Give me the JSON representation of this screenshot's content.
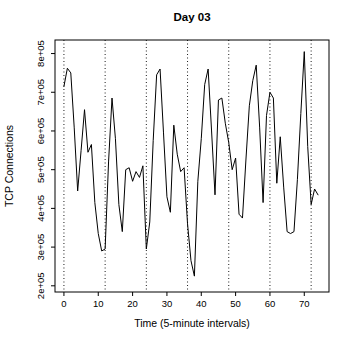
{
  "window": {
    "width": 345,
    "height": 346,
    "background": "#ffffff"
  },
  "chart_data": {
    "type": "line",
    "title": "Day 03",
    "xlabel": "Time (5-minute intervals)",
    "ylabel": "TCP Connections",
    "x": [
      0,
      1,
      2,
      3,
      4,
      5,
      6,
      7,
      8,
      9,
      10,
      11,
      12,
      13,
      14,
      15,
      16,
      17,
      18,
      19,
      20,
      21,
      22,
      23,
      24,
      25,
      26,
      27,
      28,
      29,
      30,
      31,
      32,
      33,
      34,
      35,
      36,
      37,
      38,
      39,
      40,
      41,
      42,
      43,
      44,
      45,
      46,
      47,
      48,
      49,
      50,
      51,
      52,
      53,
      54,
      55,
      56,
      57,
      58,
      59,
      60,
      61,
      62,
      63,
      64,
      65,
      66,
      67,
      68,
      69,
      70,
      71,
      72,
      73,
      74
    ],
    "series": [
      {
        "name": "TCP connections per 5-minute interval",
        "values": [
          715000,
          762000,
          750000,
          608000,
          445000,
          550000,
          655000,
          545000,
          565000,
          415000,
          335000,
          290000,
          295000,
          520000,
          685000,
          580000,
          410000,
          340000,
          500000,
          505000,
          470000,
          495000,
          480000,
          510000,
          295000,
          365000,
          575000,
          745000,
          760000,
          595000,
          430000,
          390000,
          615000,
          540000,
          495000,
          505000,
          360000,
          265000,
          225000,
          470000,
          580000,
          720000,
          760000,
          600000,
          435000,
          680000,
          685000,
          620000,
          570000,
          500000,
          530000,
          385000,
          375000,
          525000,
          665000,
          730000,
          770000,
          610000,
          415000,
          640000,
          700000,
          685000,
          465000,
          585000,
          455000,
          340000,
          335000,
          340000,
          475000,
          645000,
          805000,
          560000,
          410000,
          450000,
          435000
        ]
      }
    ],
    "xlim": [
      -2.6,
      77.2
    ],
    "ylim": [
      184000,
      835000
    ],
    "x_ticks": [
      0,
      10,
      20,
      30,
      40,
      50,
      60,
      70
    ],
    "x_tick_labels": [
      "0",
      "10",
      "20",
      "30",
      "40",
      "50",
      "60",
      "70"
    ],
    "y_ticks": [
      200000,
      300000,
      400000,
      500000,
      600000,
      700000,
      800000
    ],
    "y_tick_labels": [
      "2e+05",
      "3e+05",
      "4e+05",
      "5e+05",
      "6e+05",
      "7e+05",
      "8e+05"
    ],
    "vlines": [
      0,
      12,
      24,
      36,
      48,
      60,
      72
    ],
    "line_color": "#000000",
    "vline_color": "#000000",
    "vline_style": "dotted",
    "grid": false,
    "legend": "none"
  }
}
